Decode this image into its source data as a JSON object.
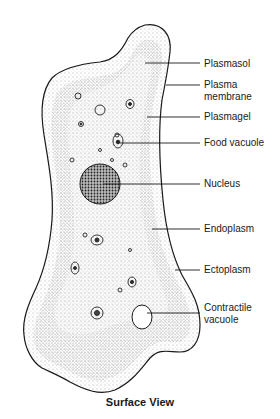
{
  "diagram": {
    "caption": "Surface View",
    "labels": [
      {
        "text": "Plasmasol",
        "y": 58
      },
      {
        "text": "Plasma\nmembrane",
        "y": 79
      },
      {
        "text": "Plasmagel",
        "y": 113
      },
      {
        "text": "Food vacuole",
        "y": 138
      },
      {
        "text": "Nucleus",
        "y": 180
      },
      {
        "text": "Endoplasm",
        "y": 225
      },
      {
        "text": "Ectoplasm",
        "y": 265
      },
      {
        "text": "Contractile\nvacuole",
        "y": 304
      }
    ],
    "colors": {
      "line": "#1a1a1a",
      "stipple": "#555555",
      "background": "#ffffff"
    }
  }
}
